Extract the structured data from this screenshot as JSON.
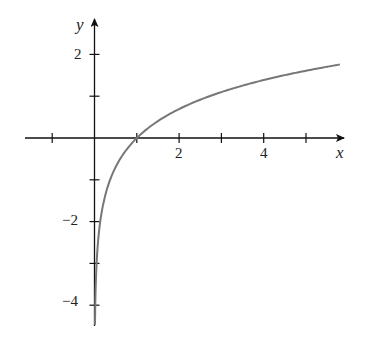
{
  "chart_data": {
    "type": "line",
    "title": "",
    "function": "y = ln x",
    "xlabel": "x",
    "ylabel": "y",
    "xlim": [
      -1.2,
      5.9
    ],
    "ylim": [
      -4.5,
      2.8
    ],
    "x_ticks": [
      -1,
      1,
      2,
      3,
      4,
      5
    ],
    "x_tick_labels": {
      "2": "2",
      "4": "4"
    },
    "y_ticks": [
      2,
      1,
      -1,
      -2,
      -3,
      -4
    ],
    "y_tick_labels": {
      "2": "2",
      "-2": "−2",
      "-4": "−4"
    },
    "grid": false,
    "legend": null,
    "series": [
      {
        "name": "ln x",
        "color": "#777777",
        "x": [
          0.011,
          0.02,
          0.05,
          0.1,
          0.2,
          0.3,
          0.5,
          0.7,
          1,
          1.5,
          2,
          2.5,
          3,
          3.5,
          4,
          4.5,
          5,
          5.5,
          5.8
        ],
        "y": [
          -4.5,
          -3.91,
          -3.0,
          -2.3,
          -1.61,
          -1.2,
          -0.69,
          -0.36,
          0,
          0.41,
          0.69,
          0.92,
          1.1,
          1.25,
          1.39,
          1.5,
          1.61,
          1.7,
          1.76
        ]
      }
    ]
  },
  "labels": {
    "x_axis": "x",
    "y_axis": "y",
    "tick_x_2": "2",
    "tick_x_4": "4",
    "tick_y_2": "2",
    "tick_y_m2": "−2",
    "tick_y_m4": "−4"
  },
  "colors": {
    "axis": "#111111",
    "curve": "#777777"
  }
}
